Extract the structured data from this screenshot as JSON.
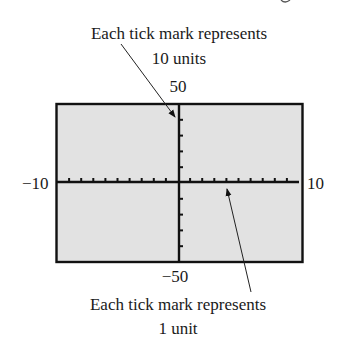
{
  "diagram": {
    "type": "graphing-calculator-viewing-window",
    "top_caption": {
      "line1": "Each tick mark represents",
      "line2": "10 units"
    },
    "bottom_caption": {
      "line1": "Each tick mark represents",
      "line2": "1 unit"
    },
    "window": {
      "xmin": -10,
      "xmax": 10,
      "xscl": 1,
      "ymin": -50,
      "ymax": 50,
      "yscl": 10
    },
    "labels": {
      "ymax": "50",
      "ymin": "−50",
      "xmin": "−10",
      "xmax": "10"
    },
    "colors": {
      "screen_fill": "#e2e2e2",
      "border": "#111111",
      "axis": "#111111",
      "text": "#1a1a1a"
    }
  }
}
